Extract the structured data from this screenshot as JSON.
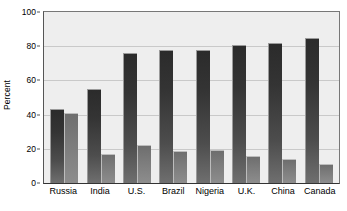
{
  "chart_data": {
    "type": "bar",
    "title": "",
    "xlabel": "",
    "ylabel": "Percent",
    "ylim": [
      0,
      100
    ],
    "yticks": [
      0,
      20,
      40,
      60,
      80,
      100
    ],
    "ytick_labels": [
      "0",
      "20",
      "40",
      "60",
      "80",
      "100"
    ],
    "grid": true,
    "grid_axis": "y",
    "legend": "none",
    "categories": [
      "Russia",
      "India",
      "U.S.",
      "Brazil",
      "Nigeria",
      "U.K.",
      "China",
      "Canada"
    ],
    "series": [
      {
        "name": "series-1",
        "color": "#333333",
        "values": [
          43,
          55,
          76,
          78,
          78,
          81,
          82,
          85
        ]
      },
      {
        "name": "series-2",
        "color": "#808080",
        "values": [
          41,
          17,
          22,
          19,
          19.5,
          16,
          14,
          11
        ]
      }
    ]
  },
  "axes": {
    "y_title": "Percent",
    "y_tick_labels": [
      "100",
      "80",
      "60",
      "40",
      "20",
      "0"
    ],
    "x_tick_labels": [
      "Russia",
      "India",
      "U.S.",
      "Brazil",
      "Nigeria",
      "U.K.",
      "China",
      "Canada"
    ]
  },
  "colors": {
    "plot_background": "#eeeeee",
    "gridline": "#c9c9c9",
    "axis": "#333333",
    "bar_primary": "#333333",
    "bar_secondary": "#808080",
    "text": "#000000"
  }
}
